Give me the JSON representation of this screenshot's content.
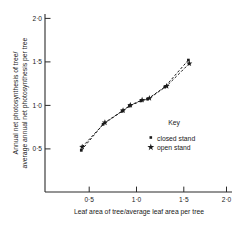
{
  "chart_data": {
    "type": "line",
    "title": "",
    "xlabel": "Leaf area of tree/average leaf area per tree",
    "ylabel_line1": "Annual net photosynthesis of tree/",
    "ylabel_line2": "average annual net photosynthesis per tree",
    "xlim": [
      0.0,
      2.0
    ],
    "ylim": [
      0.0,
      2.0
    ],
    "xticks": [
      "0·5",
      "1·0",
      "1·5",
      "2·0"
    ],
    "xtick_values": [
      0.5,
      1.0,
      1.5,
      2.0
    ],
    "yticks": [
      "0·5",
      "1·0",
      "1·5",
      "2·0"
    ],
    "ytick_values": [
      0.5,
      1.0,
      1.5,
      2.0
    ],
    "grid": false,
    "legend_position": "inside-lower-right",
    "legend_title": "Key",
    "series": [
      {
        "name": "closed stand",
        "marker": "square",
        "linestyle": "dashed",
        "x": [
          0.4,
          0.64,
          0.85,
          0.93,
          1.06,
          1.13,
          1.32,
          1.58
        ],
        "y": [
          0.48,
          0.78,
          0.93,
          0.99,
          1.05,
          1.07,
          1.21,
          1.52
        ]
      },
      {
        "name": "open stand",
        "marker": "star",
        "linestyle": "dashed",
        "x": [
          0.41,
          0.66,
          0.86,
          0.94,
          1.07,
          1.15,
          1.34,
          1.59
        ],
        "y": [
          0.52,
          0.8,
          0.94,
          1.0,
          1.06,
          1.08,
          1.22,
          1.48
        ]
      }
    ]
  },
  "legend": {
    "title": "Key",
    "entries": [
      {
        "label": "closed stand",
        "marker": "square-marker"
      },
      {
        "label": "open stand",
        "marker": "star-marker"
      }
    ]
  },
  "axes": {
    "x_title": "Leaf area of tree/average leaf area per tree",
    "y_title_line1": "Annual net photosynthesis of tree/",
    "y_title_line2": "average annual net photosynthesis per tree",
    "x_tick_labels": [
      "0·5",
      "1·0",
      "1·5",
      "2·0"
    ],
    "y_tick_labels": [
      "0·5",
      "1·0",
      "1·5",
      "2·0"
    ]
  },
  "colors": {
    "ink": "#1a1a1a",
    "axis": "#2b2b2b",
    "background": "#ffffff"
  }
}
